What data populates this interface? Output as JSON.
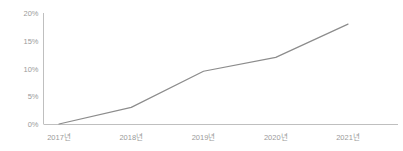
{
  "chart_data": {
    "type": "line",
    "title": "",
    "subtitle": "",
    "xlabel": "",
    "ylabel": "",
    "categories": [
      "2017년",
      "2018년",
      "2019년",
      "2020년",
      "2021년"
    ],
    "values": [
      0,
      3,
      9.5,
      12,
      18
    ],
    "series": [
      {
        "name": "",
        "values": [
          0,
          3,
          9.5,
          12,
          18
        ]
      }
    ],
    "y_tick_labels": [
      "0%",
      "5%",
      "10%",
      "15%",
      "20%"
    ],
    "y_tick_values": [
      0,
      5,
      10,
      15,
      20
    ],
    "ylim": [
      0,
      20
    ],
    "grid": false,
    "legend": "none",
    "line_color": "#8c8c8c",
    "axis_color": "#bfbfbf",
    "tick_label_color": "#9a9a9a",
    "background_color": "#ffffff",
    "markers": false,
    "value_suffix": "%"
  }
}
